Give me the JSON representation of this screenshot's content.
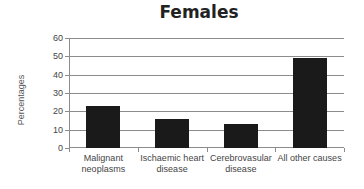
{
  "chart_data": {
    "type": "bar",
    "title": "Females",
    "xlabel": "",
    "ylabel": "Percentages",
    "categories": [
      "Malignant neoplasms",
      "Ischaemic heart disease",
      "Cerebrovasular disease",
      "All other causes"
    ],
    "category_lines": [
      [
        "Malignant",
        "neoplasms"
      ],
      [
        "Ischaemic heart",
        "disease"
      ],
      [
        "Cerebrovasular",
        "disease"
      ],
      [
        "All other causes",
        ""
      ]
    ],
    "values": [
      23,
      16,
      13,
      49
    ],
    "ylim": [
      0,
      60
    ],
    "yticks": [
      0,
      10,
      20,
      30,
      40,
      50,
      60
    ],
    "grid": true,
    "legend": "none",
    "bar_color": "#1a1a1a"
  }
}
